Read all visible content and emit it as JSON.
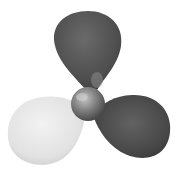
{
  "image": {
    "subject": "three-blade propeller",
    "description": "Grayscale 3D rendering of a three-blade propeller with a spherical hub; top blade dark gray, right blade dark gray, lower-left blade light gray, on white background",
    "colors": {
      "background": "#ffffff",
      "blade_dark": "#555555",
      "blade_dark_shadow": "#3a3a3a",
      "blade_light": "#e6e6e6",
      "blade_light_shadow": "#c8c8c8",
      "hub": "#7a7a7a",
      "hub_highlight": "#bdbdbd"
    }
  }
}
